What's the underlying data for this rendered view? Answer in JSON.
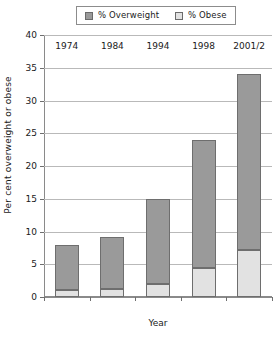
{
  "legend": {
    "entries": [
      {
        "label": "% Overweight",
        "color": "#9a9a9a",
        "icon": "legend-swatch-icon"
      },
      {
        "label": "% Obese",
        "color": "#e2e2e2",
        "icon": "legend-swatch-icon"
      }
    ]
  },
  "axes": {
    "y_title": "Per cent overweight or obese",
    "x_title": "Year",
    "y_ticks": [
      "0",
      "5",
      "10",
      "15",
      "20",
      "25",
      "30",
      "35",
      "40"
    ],
    "x_ticks": [
      "1974",
      "1984",
      "1994",
      "1998",
      "2001/2"
    ]
  },
  "chart_data": {
    "type": "bar",
    "stacked": true,
    "title": "",
    "xlabel": "Year",
    "ylabel": "Per cent overweight or obese",
    "categories": [
      "1974",
      "1984",
      "1994",
      "1998",
      "2001/2"
    ],
    "series": [
      {
        "name": "% Obese",
        "color": "#e2e2e2",
        "values": [
          1.0,
          1.2,
          2.0,
          4.5,
          7.2
        ]
      },
      {
        "name": "% Overweight",
        "color": "#9a9a9a",
        "values": [
          7.0,
          8.0,
          13.0,
          19.5,
          26.8
        ]
      }
    ],
    "totals": [
      8.0,
      9.2,
      15.0,
      24.0,
      34.0
    ],
    "ylim": [
      0,
      40
    ],
    "ytick_step": 5,
    "grid": true,
    "legend_position": "top"
  }
}
